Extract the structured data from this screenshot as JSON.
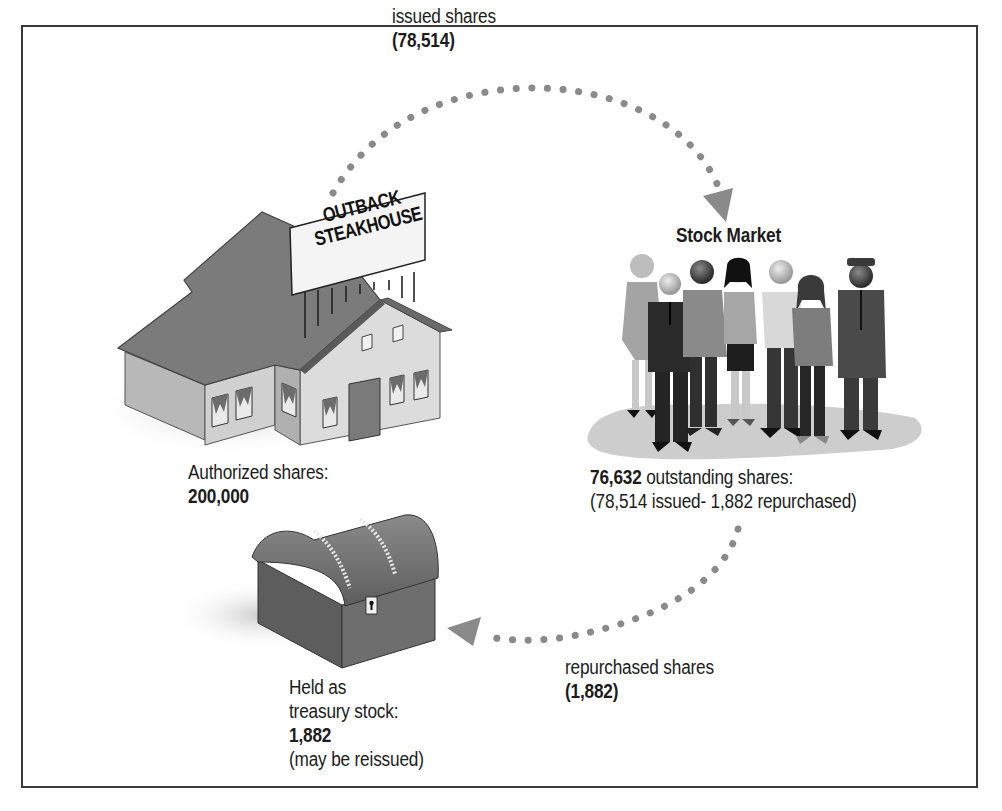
{
  "diagram": {
    "nodes": {
      "company": {
        "sign_line1": "OUTBACK",
        "sign_line2": "STEAKHOUSE",
        "label": "Authorized shares:",
        "value": "200,000"
      },
      "market": {
        "title": "Stock Market",
        "value": "76,632",
        "label": "outstanding shares:",
        "detail": "(78,514 issued- 1,882 repurchased)"
      },
      "treasury": {
        "line1": "Held as",
        "line2": "treasury stock:",
        "value": "1,882",
        "note": "(may be reissued)"
      }
    },
    "edges": {
      "issued": {
        "label": "issued shares",
        "value": "(78,514)",
        "from": "company",
        "to": "market"
      },
      "repurchased": {
        "label": "repurchased shares",
        "value": "(1,882)",
        "from": "market",
        "to": "treasury"
      }
    },
    "icons": [
      "restaurant-building-icon",
      "people-crowd-icon",
      "treasure-chest-icon",
      "arrow-head-icon"
    ],
    "colors": {
      "dots": "#8a8a8a",
      "roof": "#7b7b7b",
      "wall": "#d2d2d2",
      "wall_dark": "#a9a9a9",
      "chest": "#6e6e6e",
      "frame": "#3a3a3a"
    }
  }
}
